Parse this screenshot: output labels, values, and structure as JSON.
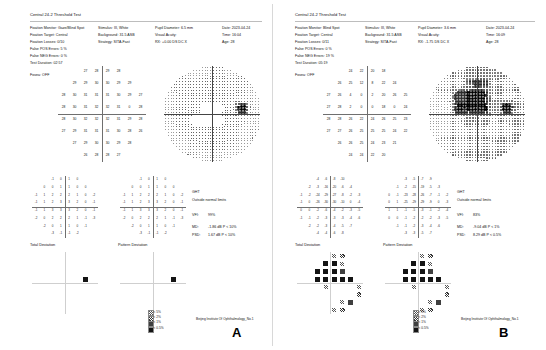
{
  "document": {
    "footer_a": "Beijing Institute Of Ophthalmology_No.1",
    "footer_b": "Beijing Institute Of Ophthalmology_No.1",
    "panel_a_label": "A",
    "panel_b_label": "B"
  },
  "legend": {
    "title": "",
    "rows": [
      {
        "symbol": "p5",
        "label": "< 5%"
      },
      {
        "symbol": "p2",
        "label": "< 2%"
      },
      {
        "symbol": "p1",
        "label": "< 1%"
      },
      {
        "symbol": "p05",
        "label": "< 0.5%"
      }
    ]
  },
  "eyes": [
    {
      "id": "A",
      "title": "Central 24-2 Threshold Test",
      "params_col1": [
        "Fixation Monitor: Gaze/Blind Spot",
        "Fixation Target: Central",
        "Fixation Losses: 0/10",
        "False POS Errors: 5 %",
        "False NEG Errors: 0 %",
        "Test Duration: 02:57"
      ],
      "fovea": "Fovea: OFF",
      "params_col2": [
        "Stimulus: III, White",
        "Background: 31.5 ASB",
        "Strategy: SITA-Fast"
      ],
      "params_col3": [
        "Pupil Diameter: 6.5 mm",
        "Visual Acuity:",
        "RX: +0.00 DS       DC  X"
      ],
      "params_col4": [
        "Date: 2023-04-24",
        "Time: 16:04",
        "Age: 28"
      ],
      "indices": {
        "ght_label": "GHT",
        "ght_value": "Outside normal limits",
        "vfi_label": "VFI:",
        "vfi_value": "99%",
        "md_label": "MD:",
        "md_value": "-1.86 dB  P < 10%",
        "psd_label": "PSD:",
        "psd_value": "1.67 dB  P < 10%"
      },
      "maps": {
        "total_deviation_title": "Total Deviation",
        "pattern_deviation_title": "Pattern Deviation"
      },
      "threshold_values": [
        [
          27,
          28,
          29,
          28
        ],
        [
          29,
          29,
          30,
          30,
          29,
          29
        ],
        [
          28,
          30,
          31,
          31,
          31,
          30,
          29,
          27
        ],
        [
          28,
          30,
          31,
          32,
          32,
          31,
          0,
          28
        ],
        [
          28,
          30,
          32,
          32,
          32,
          31,
          29,
          28
        ],
        [
          27,
          29,
          31,
          31,
          31,
          30,
          28,
          26
        ],
        [
          27,
          29,
          30,
          30,
          29,
          28
        ],
        [
          26,
          28,
          28,
          27
        ]
      ],
      "total_deviation_values": [
        [
          -1,
          0,
          1,
          0
        ],
        [
          0,
          0,
          1,
          1,
          0,
          0
        ],
        [
          -1,
          1,
          2,
          2,
          2,
          1,
          0,
          -2
        ],
        [
          -1,
          1,
          2,
          3,
          3,
          2,
          0,
          -1
        ],
        [
          -1,
          1,
          3,
          3,
          3,
          2,
          0,
          -1
        ],
        [
          -2,
          0,
          2,
          2,
          2,
          1,
          -1,
          -3
        ],
        [
          -2,
          0,
          1,
          1,
          0,
          -1
        ],
        [
          -3,
          -1,
          -1,
          -2
        ]
      ],
      "pattern_deviation_values": [
        [
          -1,
          0,
          1,
          0
        ],
        [
          0,
          0,
          1,
          1,
          0,
          0
        ],
        [
          -1,
          1,
          2,
          2,
          2,
          1,
          0,
          -2
        ],
        [
          -1,
          1,
          2,
          3,
          3,
          2,
          0,
          -1
        ],
        [
          -1,
          1,
          3,
          3,
          3,
          2,
          0,
          -1
        ],
        [
          -2,
          0,
          2,
          2,
          2,
          1,
          -1,
          -3
        ],
        [
          -2,
          0,
          1,
          1,
          0,
          -1
        ],
        [
          -3,
          -1,
          -1,
          -2
        ]
      ],
      "td_flags": [
        [
          "",
          "",
          "",
          ""
        ],
        [
          "",
          "",
          "",
          "",
          "",
          ""
        ],
        [
          "",
          "",
          "",
          "",
          "",
          "",
          "",
          ""
        ],
        [
          "",
          "",
          "",
          "",
          "",
          "",
          "p05",
          ""
        ],
        [
          "",
          "",
          "",
          "",
          "",
          "",
          "",
          ""
        ],
        [
          "",
          "",
          "",
          "",
          "",
          "",
          "",
          ""
        ],
        [
          "",
          "",
          "",
          "",
          "",
          ""
        ],
        [
          "",
          "",
          "",
          ""
        ]
      ],
      "pd_flags": [
        [
          "",
          "",
          "",
          ""
        ],
        [
          "",
          "",
          "",
          "",
          "",
          ""
        ],
        [
          "",
          "",
          "",
          "",
          "",
          "",
          "",
          ""
        ],
        [
          "",
          "",
          "",
          "",
          "",
          "",
          "p05",
          ""
        ],
        [
          "",
          "",
          "",
          "",
          "",
          "",
          "",
          ""
        ],
        [
          "",
          "",
          "",
          "",
          "",
          "",
          "",
          ""
        ],
        [
          "",
          "",
          "",
          "",
          "",
          ""
        ],
        [
          "",
          "",
          "",
          ""
        ]
      ],
      "grayscale_note": ""
    },
    {
      "id": "B",
      "title": "Central 24-2 Threshold Test",
      "params_col1": [
        "Fixation Monitor: Blind Spot",
        "Fixation Target: Central",
        "Fixation Losses: 0/11",
        "False POS Errors: 0 %",
        "False NEG Errors: 19 %",
        "Test Duration: 05:19"
      ],
      "fovea": "Fovea: OFF",
      "params_col2": [
        "Stimulus: III, White",
        "Background: 31.5 ASB",
        "Strategy: SITA-Fast"
      ],
      "params_col3": [
        "Pupil Diameter: 3.6 mm",
        "Visual Acuity:",
        "RX: -1.75 DS        DC  X"
      ],
      "params_col4": [
        "Date: 2023-04-24",
        "Time: 16:09",
        "Age: 28"
      ],
      "indices": {
        "ght_label": "GHT",
        "ght_value": "Outside normal limits",
        "vfi_label": "VFI:",
        "vfi_value": "83%",
        "md_label": "MD:",
        "md_value": "-9.04 dB  P < 1%",
        "psd_label": "PSD:",
        "psd_value": "8.29 dB  P < 0.5%"
      },
      "maps": {
        "total_deviation_title": "Total Deviation",
        "pattern_deviation_title": "Pattern Deviation"
      },
      "threshold_values": [
        [
          24,
          22,
          20,
          18
        ],
        [
          26,
          25,
          12,
          8,
          22,
          24
        ],
        [
          27,
          26,
          4,
          0,
          2,
          20,
          26,
          25
        ],
        [
          27,
          28,
          2,
          0,
          0,
          18,
          0,
          24
        ],
        [
          28,
          28,
          26,
          22,
          24,
          26,
          25,
          23
        ],
        [
          27,
          27,
          26,
          25,
          25,
          25,
          24,
          22
        ],
        [
          26,
          26,
          25,
          24,
          23,
          21
        ],
        [
          24,
          24,
          22,
          20
        ]
      ],
      "total_deviation_values": [
        [
          -4,
          -6,
          -8,
          -10
        ],
        [
          -2,
          -3,
          -16,
          -20,
          -6,
          -4
        ],
        [
          -1,
          -2,
          -24,
          -29,
          -27,
          -8,
          -2,
          -3
        ],
        [
          -1,
          0,
          -26,
          -30,
          -30,
          -10,
          0,
          -4
        ],
        [
          0,
          0,
          -2,
          -6,
          -4,
          -2,
          -3,
          -5
        ],
        [
          -1,
          -1,
          -2,
          -3,
          -3,
          -3,
          -4,
          -6
        ],
        [
          -2,
          -2,
          -3,
          -4,
          -5,
          -7
        ],
        [
          -4,
          -4,
          -6,
          -8
        ]
      ],
      "pattern_deviation_values": [
        [
          -3,
          -5,
          -7,
          -9
        ],
        [
          -1,
          -2,
          -15,
          -19,
          -5,
          -3
        ],
        [
          0,
          -1,
          -23,
          -28,
          -26,
          -7,
          -1,
          -2
        ],
        [
          0,
          1,
          -25,
          -29,
          -29,
          -9,
          0,
          -3
        ],
        [
          1,
          1,
          -1,
          -5,
          -3,
          -1,
          -2,
          -4
        ],
        [
          0,
          0,
          -1,
          -2,
          -2,
          -2,
          -3,
          -5
        ],
        [
          -1,
          -1,
          -2,
          -3,
          -4,
          -6
        ],
        [
          -3,
          -3,
          -5,
          -7
        ]
      ],
      "td_flags": [
        [
          "",
          "",
          "p5",
          "p2"
        ],
        [
          "",
          "",
          "p05",
          "p05",
          "p5",
          ""
        ],
        [
          "",
          "",
          "p05",
          "p05",
          "p05",
          "p1",
          "",
          ""
        ],
        [
          "",
          "",
          "p05",
          "p05",
          "p05",
          "p05",
          "p05",
          ""
        ],
        [
          "",
          "",
          "",
          "p5",
          "",
          "",
          "",
          "p5"
        ],
        [
          "",
          "",
          "",
          "",
          "",
          "",
          "",
          "p2"
        ],
        [
          "",
          "",
          "",
          "",
          "p5",
          "p1"
        ],
        [
          "",
          "",
          "p5",
          "p2"
        ]
      ],
      "pd_flags": [
        [
          "",
          "",
          "p5",
          "p2"
        ],
        [
          "",
          "",
          "p05",
          "p05",
          "p5",
          ""
        ],
        [
          "",
          "",
          "p05",
          "p05",
          "p05",
          "p1",
          "",
          ""
        ],
        [
          "",
          "",
          "p05",
          "p05",
          "p05",
          "p05",
          "p05",
          ""
        ],
        [
          "",
          "",
          "",
          "p5",
          "",
          "",
          "",
          "p5"
        ],
        [
          "",
          "",
          "",
          "",
          "",
          "",
          "",
          "p2"
        ],
        [
          "",
          "",
          "",
          "",
          "p5",
          "p1"
        ],
        [
          "",
          "",
          "p5",
          "p2"
        ]
      ],
      "grayscale_note": ""
    }
  ]
}
